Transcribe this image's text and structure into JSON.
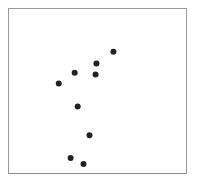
{
  "chart_data": {
    "type": "scatter",
    "title": "",
    "xlabel": "",
    "ylabel": "",
    "xlim": [
      0,
      100
    ],
    "ylim": [
      0,
      100
    ],
    "grid": false,
    "legend": null,
    "axes_ticks_visible": false,
    "marker": {
      "shape": "circle",
      "color": "#222222",
      "radius_px": 3
    },
    "frame_color": "#9a9a9a",
    "series": [
      {
        "name": "points",
        "points": [
          {
            "x": 59.0,
            "y": 73.9
          },
          {
            "x": 49.4,
            "y": 66.7
          },
          {
            "x": 37.1,
            "y": 61.2
          },
          {
            "x": 48.9,
            "y": 60.0
          },
          {
            "x": 28.1,
            "y": 54.5
          },
          {
            "x": 38.8,
            "y": 40.6
          },
          {
            "x": 45.5,
            "y": 23.0
          },
          {
            "x": 34.8,
            "y": 9.1
          },
          {
            "x": 42.1,
            "y": 5.5
          }
        ]
      }
    ]
  }
}
